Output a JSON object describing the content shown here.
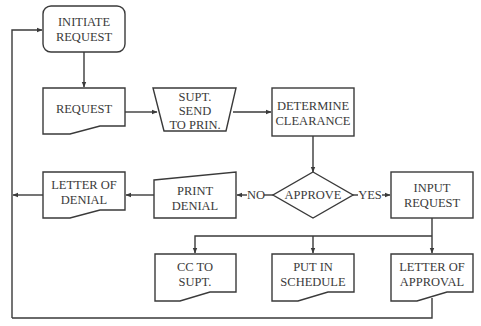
{
  "diagram": {
    "type": "flowchart",
    "colors": {
      "stroke": "#3a3a3a",
      "background": "#ffffff",
      "text": "#3a3a3a"
    },
    "nodes": {
      "initiate_request": {
        "shape": "rounded-rectangle",
        "line1": "INITIATE",
        "line2": "REQUEST"
      },
      "request": {
        "shape": "document",
        "line1": "REQUEST"
      },
      "supt_send": {
        "shape": "trapezoid",
        "line1": "SUPT.",
        "line2": "SEND",
        "line3": "TO PRIN."
      },
      "determine_clearance": {
        "shape": "rectangle",
        "line1": "DETERMINE",
        "line2": "CLEARANCE"
      },
      "approve": {
        "shape": "diamond",
        "line1": "APPROVE"
      },
      "print_denial": {
        "shape": "manual-input",
        "line1": "PRINT",
        "line2": "DENIAL"
      },
      "letter_of_denial": {
        "shape": "document",
        "line1": "LETTER OF",
        "line2": "DENIAL"
      },
      "input_request": {
        "shape": "rectangle",
        "line1": "INPUT",
        "line2": "REQUEST"
      },
      "cc_to_supt": {
        "shape": "document",
        "line1": "CC TO",
        "line2": "SUPT."
      },
      "put_in_schedule": {
        "shape": "document",
        "line1": "PUT IN",
        "line2": "SCHEDULE"
      },
      "letter_of_approval": {
        "shape": "document",
        "line1": "LETTER OF",
        "line2": "APPROVAL"
      }
    },
    "edge_labels": {
      "no": "NO",
      "yes": "YES"
    },
    "edges": [
      {
        "from": "initiate_request",
        "to": "request"
      },
      {
        "from": "request",
        "to": "supt_send"
      },
      {
        "from": "supt_send",
        "to": "determine_clearance"
      },
      {
        "from": "determine_clearance",
        "to": "approve"
      },
      {
        "from": "approve",
        "to": "print_denial",
        "label": "NO"
      },
      {
        "from": "approve",
        "to": "input_request",
        "label": "YES"
      },
      {
        "from": "print_denial",
        "to": "letter_of_denial"
      },
      {
        "from": "letter_of_denial",
        "to": "initiate_request"
      },
      {
        "from": "input_request",
        "to": "cc_to_supt"
      },
      {
        "from": "input_request",
        "to": "put_in_schedule"
      },
      {
        "from": "input_request",
        "to": "letter_of_approval"
      },
      {
        "from": "letter_of_approval",
        "to": "initiate_request"
      }
    ]
  }
}
